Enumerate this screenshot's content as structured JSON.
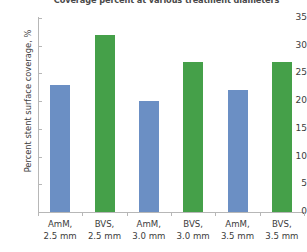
{
  "chart_data": {
    "type": "bar",
    "title": "Coverage percent at various treatment diameters",
    "xlabel": "",
    "ylabel": "Percent stent surface coverage, %",
    "ylim": [
      0,
      35
    ],
    "yticks": [
      0,
      5,
      10,
      15,
      20,
      25,
      30,
      35
    ],
    "grid": false,
    "legend": "none",
    "categories": [
      "AmM, 2.5 mm",
      "BVS, 2.5 mm",
      "AmM, 3.0 mm",
      "BVS, 3.0 mm",
      "AmM, 3.5 mm",
      "BVS, 3.5 mm"
    ],
    "category_lines": [
      [
        "AmM,",
        "2.5 mm"
      ],
      [
        "BVS,",
        "2.5 mm"
      ],
      [
        "AmM,",
        "3.0 mm"
      ],
      [
        "BVS,",
        "3.0 mm"
      ],
      [
        "AmM,",
        "3.5 mm"
      ],
      [
        "BVS,",
        "3.5 mm"
      ]
    ],
    "values": [
      23,
      32,
      20,
      27,
      22,
      27
    ],
    "bar_colors": [
      "#6b8fc4",
      "#45a049",
      "#6b8fc4",
      "#45a049",
      "#6b8fc4",
      "#45a049"
    ],
    "colors": {
      "device_amm": "#6b8fc4",
      "device_bvs": "#45a049",
      "axis": "#b7b7b7",
      "text": "#3c3c3c"
    }
  }
}
